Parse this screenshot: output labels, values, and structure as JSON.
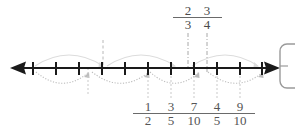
{
  "figure": {
    "type": "number-line-diagram",
    "line": {
      "y": 68,
      "x_start": 18,
      "x_end": 272,
      "color": "#1a1a1a",
      "arrow_left": true,
      "arrow_right": true,
      "tick_count": 11,
      "tick_first_x": 33,
      "tick_spacing": 22.9,
      "tick_half_height": 6
    },
    "top_labels": [
      {
        "id": "two-thirds",
        "numerator": "2",
        "denominator": "3",
        "x": 188,
        "y": 6,
        "guide_x": 188,
        "guide_style": "dash-dot"
      },
      {
        "id": "three-fourths",
        "numerator": "3",
        "denominator": "4",
        "x": 207,
        "y": 6,
        "guide_x": 207,
        "guide_style": "dash-dot"
      }
    ],
    "bottom_labels": [
      {
        "id": "one-half",
        "numerator": "1",
        "denominator": "2",
        "x": 148,
        "y": 101,
        "guide_x": 148,
        "guide_style": "dotted"
      },
      {
        "id": "three-fifths",
        "numerator": "3",
        "denominator": "5",
        "x": 171,
        "y": 101,
        "guide_x": 171,
        "guide_style": "dotted"
      },
      {
        "id": "seven-tenths",
        "numerator": "7",
        "denominator": "10",
        "x": 194,
        "y": 101,
        "guide_x": 194,
        "guide_style": "dotted"
      },
      {
        "id": "four-fifths",
        "numerator": "4",
        "denominator": "5",
        "x": 217,
        "y": 101,
        "guide_x": 217,
        "guide_style": "dotted"
      },
      {
        "id": "nine-tenths",
        "numerator": "9",
        "denominator": "10",
        "x": 240,
        "y": 101,
        "guide_x": 240,
        "guide_style": "dotted"
      }
    ],
    "extra_guides": [
      {
        "id": "guide-upper-left",
        "x": 103,
        "y_top": 40,
        "y_bottom": 68,
        "style": "dashed",
        "color": "#b8b8b8"
      },
      {
        "id": "guide-lower-left",
        "x": 88,
        "y_top": 68,
        "y_bottom": 96,
        "style": "dotted",
        "color": "#c9c9c9"
      }
    ],
    "arcs_above": [
      {
        "id": "arc-above-1",
        "x1": 35,
        "x2": 103,
        "dip": 22,
        "color": "#dcdcdc"
      },
      {
        "id": "arc-above-2",
        "x1": 107,
        "x2": 175,
        "dip": 22,
        "color": "#dcdcdc"
      },
      {
        "id": "arc-above-3",
        "x1": 192,
        "x2": 258,
        "dip": 22,
        "color": "#dcdcdc"
      }
    ],
    "arcs_below": [
      {
        "id": "arc-below-1",
        "x1": 36,
        "x2": 88,
        "rise": 20,
        "color": "#bdbdbd"
      },
      {
        "id": "arc-below-2",
        "x1": 92,
        "x2": 148,
        "rise": 20,
        "color": "#bdbdbd"
      },
      {
        "id": "arc-below-3",
        "x1": 150,
        "x2": 198,
        "rise": 20,
        "color": "#bdbdbd"
      },
      {
        "id": "arc-below-4",
        "x1": 208,
        "x2": 262,
        "rise": 20,
        "color": "#bdbdbd"
      }
    ],
    "side_shape": {
      "id": "right-rounded-rect",
      "x": 280,
      "y": 44,
      "width": 26,
      "height": 44,
      "radius": 7,
      "stroke": "#9a9a9a"
    },
    "colors": {
      "line": "#1a1a1a",
      "tick": "#1a1a1a",
      "label": "#4a4a4a",
      "arc_above": "#dcdcdc",
      "arc_below": "#bdbdbd",
      "guide_dashdot": "#9e9e9e",
      "guide_dotted": "#c9c9c9",
      "background": "#ffffff"
    }
  }
}
